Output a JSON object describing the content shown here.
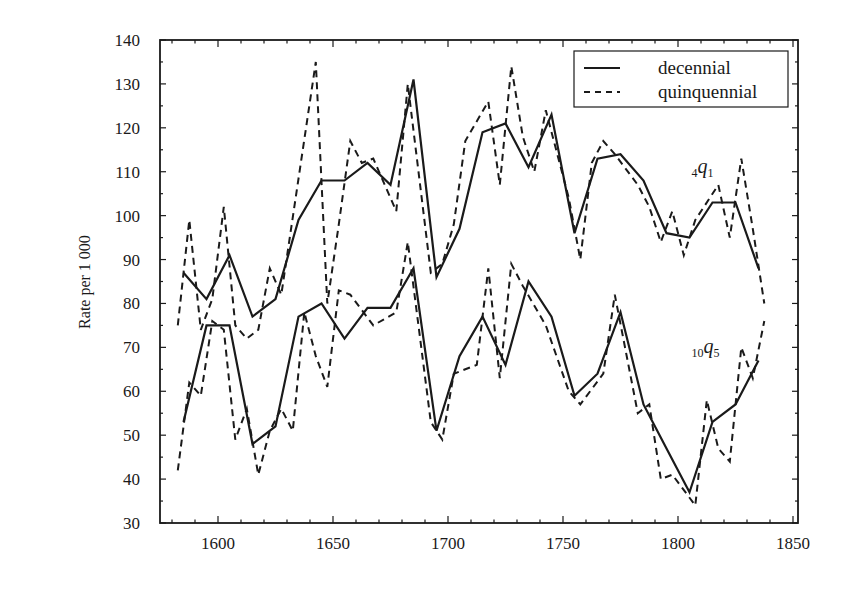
{
  "chart_data": {
    "type": "line",
    "title": "",
    "xlabel": "",
    "ylabel": "Rate per 1 000",
    "xlim": [
      1575,
      1850
    ],
    "ylim": [
      30,
      140
    ],
    "xticks": [
      1600,
      1650,
      1700,
      1750,
      1800,
      1850
    ],
    "yticks": [
      30,
      40,
      50,
      60,
      70,
      80,
      90,
      100,
      110,
      120,
      130,
      140
    ],
    "grid": false,
    "legend": {
      "position": "top-right",
      "entries": [
        {
          "label": "decennial",
          "style": "solid"
        },
        {
          "label": "quinquennial",
          "style": "dashed"
        }
      ]
    },
    "annotations": [
      {
        "text": "4q1",
        "pre": "4",
        "main": "q",
        "sub": "1",
        "x": 1812,
        "y": 111
      },
      {
        "text": "10q5",
        "pre": "10",
        "main": "q",
        "sub": "5",
        "x": 1812,
        "y": 70
      }
    ],
    "series": [
      {
        "name": "decennial 4q1",
        "style": "solid",
        "x": [
          1585,
          1595,
          1605,
          1615,
          1625,
          1635,
          1645,
          1655,
          1665,
          1675,
          1685,
          1695,
          1705,
          1715,
          1725,
          1735,
          1745,
          1755,
          1765,
          1775,
          1785,
          1795,
          1805,
          1815,
          1825,
          1835
        ],
        "values": [
          87,
          81,
          91,
          77,
          81,
          99,
          108,
          108,
          112,
          107,
          131,
          86,
          97,
          119,
          121,
          111,
          123,
          96,
          113,
          114,
          108,
          96,
          95,
          103,
          103,
          88
        ]
      },
      {
        "name": "decennial 10q5",
        "style": "solid",
        "x": [
          1585,
          1595,
          1605,
          1615,
          1625,
          1635,
          1645,
          1655,
          1665,
          1675,
          1685,
          1695,
          1705,
          1715,
          1725,
          1735,
          1745,
          1755,
          1765,
          1775,
          1785,
          1795,
          1805,
          1815,
          1825,
          1835
        ],
        "values": [
          53,
          75,
          75,
          48,
          52,
          77,
          80,
          72,
          79,
          79,
          88,
          51,
          68,
          77,
          66,
          85,
          77,
          59,
          64,
          78,
          57,
          47,
          37,
          53,
          57,
          67
        ]
      },
      {
        "name": "quinquennial 4q1",
        "style": "dashed",
        "x": [
          1582.5,
          1587.5,
          1592.5,
          1597.5,
          1602.5,
          1607.5,
          1612.5,
          1617.5,
          1622.5,
          1627.5,
          1642.5,
          1647.5,
          1652.5,
          1657.5,
          1662.5,
          1667.5,
          1677.5,
          1682.5,
          1692.5,
          1697.5,
          1702.5,
          1707.5,
          1717.5,
          1722.5,
          1727.5,
          1732.5,
          1737.5,
          1742.5,
          1752.5,
          1757.5,
          1762.5,
          1767.5,
          1772.5,
          1782.5,
          1787.5,
          1792.5,
          1797.5,
          1802.5,
          1807.5,
          1817.5,
          1822.5,
          1827.5,
          1832.5,
          1837.5
        ],
        "values": [
          75,
          99,
          74,
          81,
          102,
          75,
          72,
          74,
          88,
          82,
          135,
          80,
          98,
          117,
          112,
          113,
          101,
          130,
          87,
          89,
          98,
          117,
          126,
          107,
          134,
          118,
          110,
          124,
          104,
          90,
          112,
          117,
          114,
          107,
          102,
          94,
          101,
          91,
          99,
          107,
          95,
          113,
          97,
          80
        ]
      },
      {
        "name": "quinquennial 10q5",
        "style": "dashed",
        "x": [
          1582.5,
          1587.5,
          1592.5,
          1597.5,
          1602.5,
          1607.5,
          1612.5,
          1617.5,
          1622.5,
          1627.5,
          1632.5,
          1637.5,
          1642.5,
          1647.5,
          1652.5,
          1657.5,
          1667.5,
          1677.5,
          1682.5,
          1692.5,
          1697.5,
          1702.5,
          1712.5,
          1717.5,
          1722.5,
          1727.5,
          1732.5,
          1742.5,
          1752.5,
          1757.5,
          1767.5,
          1772.5,
          1782.5,
          1787.5,
          1792.5,
          1797.5,
          1807.5,
          1812.5,
          1817.5,
          1822.5,
          1827.5,
          1832.5,
          1837.5
        ],
        "values": [
          42,
          62,
          59,
          76,
          74,
          49,
          56,
          41,
          51,
          56,
          51,
          78,
          68,
          61,
          83,
          82,
          75,
          78,
          94,
          53,
          49,
          64,
          66,
          88,
          63,
          89,
          84,
          75,
          60,
          57,
          64,
          82,
          55,
          57,
          40,
          41,
          34,
          58,
          47,
          44,
          70,
          63,
          76
        ]
      }
    ]
  }
}
